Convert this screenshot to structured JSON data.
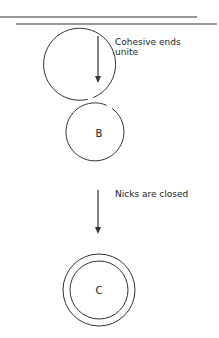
{
  "diagram": {
    "steps": [
      {
        "arrow_label_lines": [
          "Cohesive ends",
          "unite"
        ]
      },
      {
        "arrow_label_lines": [
          "Nicks are closed"
        ]
      }
    ],
    "nodes": [
      {
        "label": "B",
        "state": "nicked double-stranded circle"
      },
      {
        "label": "C",
        "state": "closed double-stranded circle"
      }
    ],
    "colors": {
      "stroke": "#333333",
      "text": "#222222",
      "background": "#ffffff"
    }
  }
}
